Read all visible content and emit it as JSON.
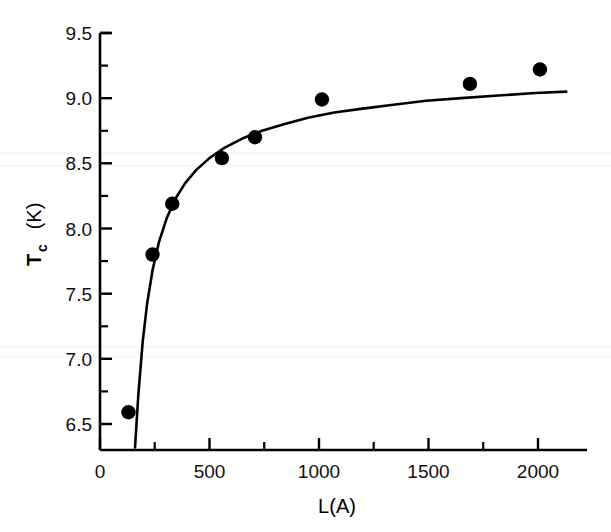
{
  "chart_data": {
    "type": "scatter",
    "title": "",
    "subtitle": "",
    "xlabel": "L(A)",
    "ylabel": "Tc (K)",
    "ylabel_main": "T",
    "ylabel_subscript": "c",
    "ylabel_unit": " (K)",
    "xlim": [
      0,
      2225
    ],
    "ylim": [
      6.3,
      9.5
    ],
    "xticks": [
      0,
      500,
      1000,
      1500,
      2000
    ],
    "xtick_labels": [
      "0",
      "500",
      "1000",
      "1500",
      "2000"
    ],
    "xminorticks": [
      250,
      750,
      1250,
      1750
    ],
    "yticks": [
      6.5,
      7.0,
      7.5,
      8.0,
      8.5,
      9.0,
      9.5
    ],
    "ytick_labels": [
      "6.5",
      "7.0",
      "7.5",
      "8.0",
      "8.5",
      "9.0",
      "9.5"
    ],
    "yminorticks": [
      6.75,
      7.25,
      7.75,
      8.25,
      8.75,
      9.25
    ],
    "grid": false,
    "legend": null,
    "marker": "filled-circle",
    "marker_color": "#000000",
    "line_color": "#000000",
    "series": [
      {
        "name": "Tc measurements",
        "type": "scatter",
        "x": [
          130,
          240,
          330,
          557,
          708,
          1014,
          1690,
          2010
        ],
        "y": [
          6.59,
          7.8,
          8.19,
          8.54,
          8.7,
          8.99,
          9.11,
          9.22
        ]
      },
      {
        "name": "fit curve",
        "type": "line",
        "x": [
          160,
          175,
          195,
          215,
          240,
          270,
          305,
          345,
          390,
          440,
          500,
          570,
          650,
          740,
          840,
          950,
          1070,
          1200,
          1340,
          1490,
          1650,
          1820,
          1990,
          2130
        ],
        "y": [
          6.32,
          6.72,
          7.13,
          7.42,
          7.68,
          7.9,
          8.08,
          8.23,
          8.35,
          8.45,
          8.54,
          8.62,
          8.69,
          8.75,
          8.8,
          8.85,
          8.89,
          8.92,
          8.95,
          8.98,
          9.0,
          9.02,
          9.04,
          9.05
        ]
      }
    ]
  }
}
